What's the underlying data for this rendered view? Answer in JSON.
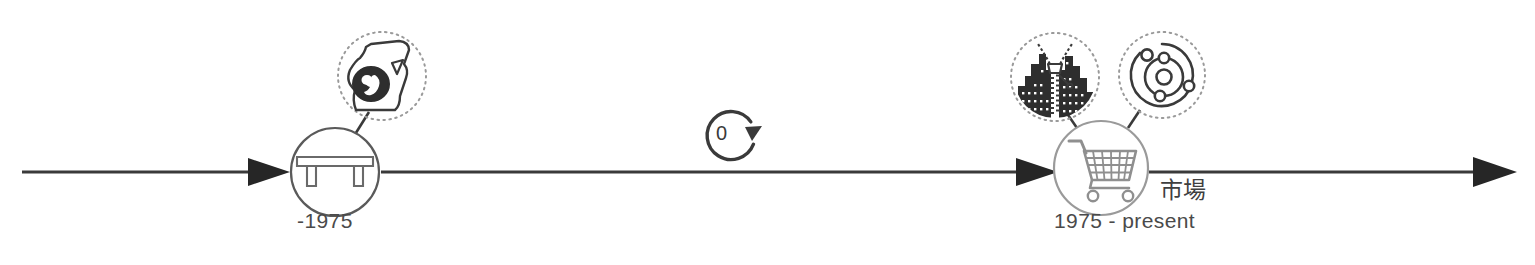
{
  "diagram": {
    "type": "timeline",
    "orientation": "horizontal",
    "axis": {
      "name": "main-timeline-axis",
      "color": "#3a3a3a",
      "start_x": 22,
      "end_x": 1513,
      "y": 172,
      "segments": 3,
      "arrowheads": 3
    },
    "milestones": [
      {
        "id": "milestone-bridge",
        "icon": "bridge-icon",
        "label": "-1975",
        "center_x": 335,
        "center_y": 172,
        "radius": 45,
        "stroke": "#5a5a5a",
        "satellites": [
          {
            "id": "satellite-pregnancy",
            "icon": "pregnancy-fetus-icon",
            "center_x": 382,
            "center_y": 76,
            "radius": 45,
            "style": "dotted"
          }
        ]
      },
      {
        "id": "milestone-cart",
        "icon": "shopping-cart-icon",
        "label": "1975 - present",
        "annotation": "市場",
        "center_x": 1101,
        "center_y": 168,
        "radius": 48,
        "stroke": "#8f8f8f",
        "satellites": [
          {
            "id": "satellite-city-zipper",
            "icon": "city-zipper-icon",
            "center_x": 1055,
            "center_y": 77,
            "radius": 45,
            "style": "dotted"
          },
          {
            "id": "satellite-orbit",
            "icon": "orbit-atom-icon",
            "center_x": 1162,
            "center_y": 75,
            "radius": 44,
            "style": "dotted"
          }
        ]
      }
    ],
    "cycle_marker": {
      "id": "cycle-marker",
      "icon": "refresh-cycle-icon",
      "value": "0",
      "center_x": 733,
      "center_y": 135,
      "radius": 27,
      "stroke": "#3a3a3a"
    },
    "colors": {
      "axis": "#3a3a3a",
      "text": "#4a4a4a",
      "milestone_left_stroke": "#5a5a5a",
      "milestone_right_stroke": "#8f8f8f",
      "satellite_dotted": "#9a9a9a",
      "icon_dark": "#3a3a3a",
      "icon_light": "#8f8f8f",
      "background": "#ffffff"
    }
  }
}
